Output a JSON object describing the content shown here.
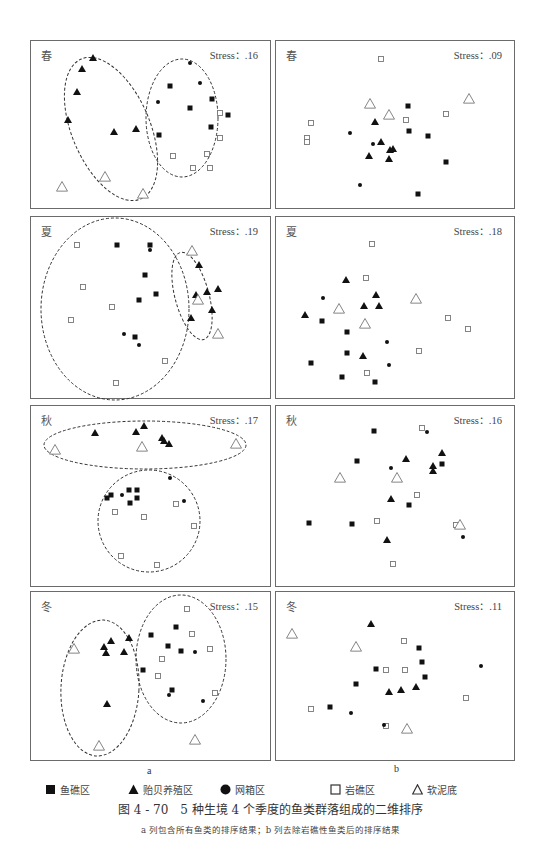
{
  "figure": {
    "caption": "图 4 - 70　5 种生境 4 个季度的鱼类群落组成的二维排序",
    "subcaption": "a 列包含所有鱼类的排序结果；b 列去除岩礁性鱼类后的排序结果",
    "column_labels": {
      "a": "a",
      "b": "b"
    }
  },
  "legend": [
    {
      "key": "fish_reef",
      "label": "鱼礁区",
      "symbol": "filled-square"
    },
    {
      "key": "mussel_farm",
      "label": "贻贝养殖区",
      "symbol": "filled-triangle"
    },
    {
      "key": "net_cage",
      "label": "网箱区",
      "symbol": "filled-circle"
    },
    {
      "key": "rocky_reef",
      "label": "岩礁区",
      "symbol": "open-square"
    },
    {
      "key": "soft_mud",
      "label": "软泥底",
      "symbol": "open-triangle"
    }
  ],
  "colors": {
    "marker": "#111111",
    "open_marker": "#777777",
    "ellipse": "#333333",
    "border": "#6b6b6b"
  },
  "panels": {
    "a_spring": {
      "season": "春",
      "stress": "Stress：.16"
    },
    "b_spring": {
      "season": "春",
      "stress": "Stress：.09"
    },
    "a_summer": {
      "season": "夏",
      "stress": "Stress：.19"
    },
    "b_summer": {
      "season": "夏",
      "stress": "Stress：.18"
    },
    "a_autumn": {
      "season": "秋",
      "stress": "Stress：.17"
    },
    "b_autumn": {
      "season": "秋",
      "stress": "Stress：.16"
    },
    "a_winter": {
      "season": "冬",
      "stress": "Stress：.15"
    },
    "b_winter": {
      "season": "冬",
      "stress": "Stress：.11"
    }
  },
  "chart_data": [
    {
      "type": "scatter",
      "title": "春 (a)",
      "annotation": "Stress：.16",
      "grid": false,
      "series": [
        {
          "name": "贻贝养殖区",
          "points": [
            [
              92,
              57
            ],
            [
              81,
              68
            ],
            [
              76,
              91
            ],
            [
              67,
              119
            ],
            [
              113,
              131
            ],
            [
              135,
              128
            ]
          ]
        },
        {
          "name": "鱼礁区",
          "points": [
            [
              169,
              85
            ],
            [
              211,
              98
            ],
            [
              189,
              107
            ],
            [
              227,
              114
            ],
            [
              210,
              126
            ],
            [
              158,
              134
            ]
          ]
        },
        {
          "name": "网箱区",
          "points": [
            [
              189,
              62
            ],
            [
              199,
              82
            ],
            [
              157,
              101
            ]
          ]
        },
        {
          "name": "岩礁区",
          "points": [
            [
              219,
              112
            ],
            [
              219,
              137
            ],
            [
              172,
              155
            ],
            [
              206,
              153
            ],
            [
              192,
              167
            ],
            [
              209,
              167
            ]
          ]
        },
        {
          "name": "软泥底",
          "points": [
            [
              104,
              176
            ],
            [
              61,
              186
            ],
            [
              142,
              193
            ]
          ]
        }
      ]
    },
    {
      "type": "scatter",
      "title": "春 (b)",
      "annotation": "Stress：.09",
      "grid": false,
      "series": [
        {
          "name": "鱼礁区",
          "points": [
            [
              407,
              105
            ],
            [
              408,
              130
            ],
            [
              427,
              135
            ],
            [
              445,
              161
            ],
            [
              417,
              193
            ]
          ]
        },
        {
          "name": "贻贝养殖区",
          "points": [
            [
              374,
              121
            ],
            [
              380,
              141
            ],
            [
              368,
              155
            ],
            [
              392,
              148
            ],
            [
              389,
              149
            ],
            [
              388,
              158
            ]
          ]
        },
        {
          "name": "网箱区",
          "points": [
            [
              349,
              132
            ],
            [
              372,
              143
            ],
            [
              359,
              184
            ]
          ]
        },
        {
          "name": "岩礁区",
          "points": [
            [
              380,
              58
            ],
            [
              405,
              119
            ],
            [
              445,
              113
            ],
            [
              310,
              122
            ],
            [
              306,
              137
            ],
            [
              306,
              141
            ]
          ]
        },
        {
          "name": "软泥底",
          "points": [
            [
              369,
              103
            ],
            [
              388,
              114
            ],
            [
              468,
              98
            ]
          ]
        }
      ]
    },
    {
      "type": "scatter",
      "title": "夏 (a)",
      "annotation": "Stress：.19",
      "grid": false,
      "series": [
        {
          "name": "鱼礁区",
          "points": [
            [
              116,
              244
            ],
            [
              149,
              244
            ],
            [
              144,
              274
            ],
            [
              155,
              293
            ],
            [
              138,
              299
            ],
            [
              134,
              336
            ]
          ]
        },
        {
          "name": "网箱区",
          "points": [
            [
              149,
              249
            ],
            [
              123,
              333
            ],
            [
              138,
              344
            ]
          ]
        },
        {
          "name": "岩礁区",
          "points": [
            [
              76,
              244
            ],
            [
              82,
              286
            ],
            [
              111,
              306
            ],
            [
              70,
              319
            ],
            [
              164,
              360
            ],
            [
              115,
              382
            ]
          ]
        },
        {
          "name": "贻贝养殖区",
          "points": [
            [
              198,
              264
            ],
            [
              206,
              291
            ],
            [
              217,
              288
            ],
            [
              195,
              294
            ],
            [
              211,
              309
            ],
            [
              190,
              317
            ]
          ]
        },
        {
          "name": "软泥底",
          "points": [
            [
              191,
              250
            ],
            [
              197,
              299
            ],
            [
              217,
              333
            ]
          ]
        }
      ]
    },
    {
      "type": "scatter",
      "title": "夏 (b)",
      "annotation": "Stress：.18",
      "grid": false,
      "series": [
        {
          "name": "贻贝养殖区",
          "points": [
            [
              345,
              279
            ],
            [
              375,
              294
            ],
            [
              363,
              305
            ],
            [
              378,
              305
            ],
            [
              304,
              314
            ],
            [
              362,
              355
            ]
          ]
        },
        {
          "name": "网箱区",
          "points": [
            [
              322,
              297
            ],
            [
              386,
              341
            ],
            [
              388,
              364
            ]
          ]
        },
        {
          "name": "鱼礁区",
          "points": [
            [
              321,
              320
            ],
            [
              346,
              331
            ],
            [
              346,
              352
            ],
            [
              310,
              362
            ],
            [
              341,
              376
            ],
            [
              374,
              381
            ]
          ]
        },
        {
          "name": "岩礁区",
          "points": [
            [
              371,
              243
            ],
            [
              365,
              277
            ],
            [
              447,
              317
            ],
            [
              467,
              328
            ],
            [
              418,
              350
            ],
            [
              366,
              372
            ]
          ]
        },
        {
          "name": "软泥底",
          "points": [
            [
              338,
              308
            ],
            [
              364,
              323
            ],
            [
              415,
              298
            ]
          ]
        }
      ]
    },
    {
      "type": "scatter",
      "title": "秋 (a)",
      "annotation": "Stress：.17",
      "grid": false,
      "series": [
        {
          "name": "贻贝养殖区",
          "points": [
            [
              94,
              432
            ],
            [
              135,
              431
            ],
            [
              143,
              425
            ],
            [
              161,
              437
            ],
            [
              163,
              440
            ],
            [
              168,
              443
            ]
          ]
        },
        {
          "name": "软泥底",
          "points": [
            [
              54,
              449
            ],
            [
              141,
              446
            ],
            [
              235,
              443
            ]
          ]
        },
        {
          "name": "网箱区",
          "points": [
            [
              169,
              477
            ],
            [
              121,
              494
            ],
            [
              183,
              500
            ]
          ]
        },
        {
          "name": "鱼礁区",
          "points": [
            [
              110,
              494
            ],
            [
              106,
              497
            ],
            [
              128,
              489
            ],
            [
              136,
              489
            ],
            [
              136,
              497
            ],
            [
              129,
              502
            ]
          ]
        },
        {
          "name": "岩礁区",
          "points": [
            [
              114,
              511
            ],
            [
              143,
              516
            ],
            [
              175,
              503
            ],
            [
              193,
              525
            ],
            [
              120,
              555
            ],
            [
              156,
              564
            ]
          ]
        }
      ]
    },
    {
      "type": "scatter",
      "title": "秋 (b)",
      "annotation": "Stress：.16",
      "grid": false,
      "series": [
        {
          "name": "鱼礁区",
          "points": [
            [
              373,
              430
            ],
            [
              356,
              460
            ],
            [
              441,
              463
            ],
            [
              408,
              504
            ],
            [
              308,
              522
            ],
            [
              351,
              523
            ]
          ]
        },
        {
          "name": "网箱区",
          "points": [
            [
              426,
              431
            ],
            [
              390,
              467
            ],
            [
              462,
              536
            ]
          ]
        },
        {
          "name": "贻贝养殖区",
          "points": [
            [
              405,
              458
            ],
            [
              441,
              452
            ],
            [
              432,
              465
            ],
            [
              432,
              470
            ],
            [
              390,
              498
            ],
            [
              386,
              539
            ]
          ]
        },
        {
          "name": "岩礁区",
          "points": [
            [
              421,
              427
            ],
            [
              416,
              494
            ],
            [
              376,
              520
            ],
            [
              455,
              524
            ],
            [
              392,
              563
            ]
          ]
        },
        {
          "name": "软泥底",
          "points": [
            [
              339,
              477
            ],
            [
              396,
              477
            ],
            [
              459,
              524
            ]
          ]
        }
      ]
    },
    {
      "type": "scatter",
      "title": "冬 (a)",
      "annotation": "Stress：.15",
      "grid": false,
      "series": [
        {
          "name": "贻贝养殖区",
          "points": [
            [
              110,
              640
            ],
            [
              103,
              646
            ],
            [
              105,
              652
            ],
            [
              128,
              637
            ],
            [
              123,
              651
            ],
            [
              106,
              703
            ]
          ]
        },
        {
          "name": "软泥底",
          "points": [
            [
              73,
              648
            ],
            [
              98,
              745
            ],
            [
              194,
              739
            ]
          ]
        },
        {
          "name": "鱼礁区",
          "points": [
            [
              175,
              626
            ],
            [
              150,
              634
            ],
            [
              167,
              645
            ],
            [
              180,
              650
            ],
            [
              142,
              669
            ],
            [
              171,
              689
            ]
          ]
        },
        {
          "name": "网箱区",
          "points": [
            [
              194,
              651
            ],
            [
              168,
              694
            ],
            [
              202,
              700
            ]
          ]
        },
        {
          "name": "岩礁区",
          "points": [
            [
              186,
              608
            ],
            [
              191,
              633
            ],
            [
              209,
              648
            ],
            [
              161,
              658
            ],
            [
              157,
              675
            ],
            [
              214,
              692
            ]
          ]
        }
      ]
    },
    {
      "type": "scatter",
      "title": "冬 (b)",
      "annotation": "Stress：.11",
      "grid": false,
      "series": [
        {
          "name": "贻贝养殖区",
          "points": [
            [
              370,
              623
            ],
            [
              388,
              691
            ],
            [
              400,
              689
            ],
            [
              415,
              686
            ]
          ]
        },
        {
          "name": "软泥底",
          "points": [
            [
              291,
              633
            ],
            [
              355,
              646
            ],
            [
              406,
              728
            ]
          ]
        },
        {
          "name": "岩礁区",
          "points": [
            [
              403,
              640
            ],
            [
              385,
              669
            ],
            [
              404,
              669
            ],
            [
              465,
              697
            ],
            [
              310,
              708
            ],
            [
              385,
              725
            ]
          ]
        },
        {
          "name": "鱼礁区",
          "points": [
            [
              418,
              647
            ],
            [
              421,
              661
            ],
            [
              424,
              676
            ],
            [
              375,
              668
            ],
            [
              355,
              683
            ],
            [
              329,
              706
            ]
          ]
        },
        {
          "name": "网箱区",
          "points": [
            [
              480,
              665
            ],
            [
              350,
              712
            ],
            [
              383,
              724
            ]
          ]
        }
      ]
    }
  ]
}
